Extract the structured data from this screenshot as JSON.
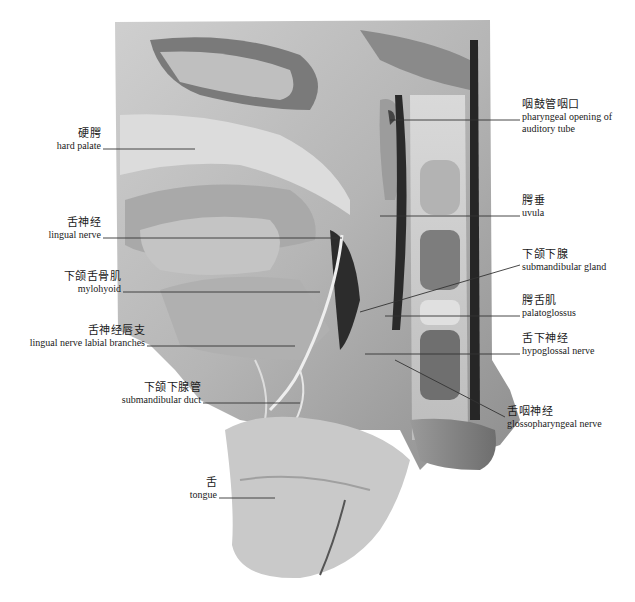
{
  "figure": {
    "type": "anatomical dissection photograph (grayscale), sagittal view of oral cavity and tongue region",
    "caption": "",
    "colors": {
      "background": "#ffffff",
      "tissue_light": "#d8d8d8",
      "tissue_mid": "#a8a8a8",
      "tissue_dark": "#3a3a3a",
      "leader_line": "#333333"
    }
  },
  "labels_left": [
    {
      "id": "hard-palate",
      "zh": "硬腭",
      "en": "hard palate"
    },
    {
      "id": "lingual-nerve",
      "zh": "舌神经",
      "en": "lingual nerve"
    },
    {
      "id": "mylohyoid",
      "zh": "下颌舌骨肌",
      "en": "mylohyoid"
    },
    {
      "id": "lingual-nerve-labial-branches",
      "zh": "舌神经唇支",
      "en": "lingual nerve labial branches"
    },
    {
      "id": "submandibular-duct",
      "zh": "下颌下腺管",
      "en": "submandibular duct"
    },
    {
      "id": "tongue",
      "zh": "舌",
      "en": "tongue"
    }
  ],
  "labels_right": [
    {
      "id": "pharyngeal-opening",
      "zh": "咽鼓管咽口",
      "en": "pharyngeal opening of",
      "en2": "auditory tube"
    },
    {
      "id": "uvula",
      "zh": "腭垂",
      "en": "uvula"
    },
    {
      "id": "submandibular-gland",
      "zh": "下颌下腺",
      "en": "submandibular gland"
    },
    {
      "id": "palatoglossus",
      "zh": "腭舌肌",
      "en": "palatoglossus"
    },
    {
      "id": "hypoglossal-nerve",
      "zh": "舌下神经",
      "en": "hypoglossal nerve"
    },
    {
      "id": "glossopharyngeal-nerve",
      "zh": "舌咽神经",
      "en": "glossopharyngeal nerve"
    }
  ]
}
